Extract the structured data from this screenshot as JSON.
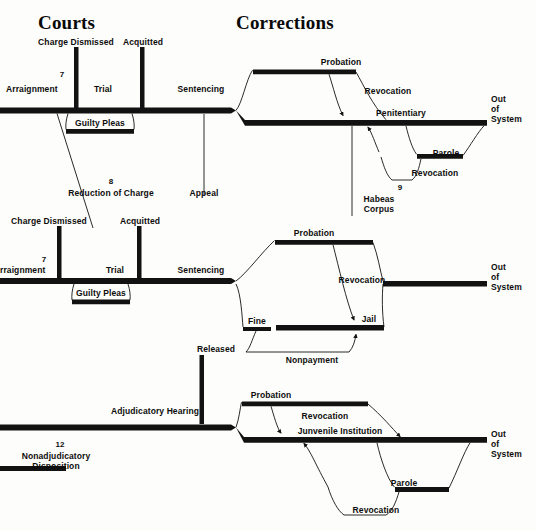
{
  "diagram": {
    "title_courts": "Courts",
    "title_corrections": "Corrections",
    "ink_color": "#121212",
    "paper_color": "#fdfdfb"
  },
  "headers": [
    {
      "name": "courts",
      "text": "Courts",
      "x": 38,
      "y": 14
    },
    {
      "name": "corrections",
      "text": "Corrections",
      "x": 236,
      "y": 14
    }
  ],
  "row_adult_felony": {
    "labels": {
      "charge_dismissed": "Charge Dismissed",
      "acquitted": "Acquitted",
      "arraignment": "Arraignment",
      "arraignment_num": "7",
      "trial": "Trial",
      "sentencing": "Sentencing",
      "guilty_pleas": "Guilty Pleas",
      "reduction_of_charge": "Reduction of Charge",
      "reduction_num": "8",
      "appeal": "Appeal",
      "probation": "Probation",
      "revocation_probation": "Revocation",
      "penitentiary": "Penitentiary",
      "parole": "Parole",
      "revocation_parole": "Revocation",
      "habeas_corpus": "Habeas\nCorpus",
      "habeas_num": "9",
      "out_of_system": "Out\nof\nSystem"
    }
  },
  "row_adult_misdemeanor": {
    "labels": {
      "charge_dismissed": "Charge Dismissed",
      "acquitted": "Acquitted",
      "arraignment": "rraignment",
      "arraignment_num": "7",
      "trial": "Trial",
      "sentencing": "Sentencing",
      "guilty_pleas": "Guilty Pleas",
      "probation": "Probation",
      "revocation": "Revocation",
      "fine": "Fine",
      "jail": "Jail",
      "nonpayment": "Nonpayment",
      "released": "Released",
      "out_of_system": "Out\nof\nSystem"
    }
  },
  "row_juvenile": {
    "labels": {
      "adjudicatory_hearing": "Adjudicatory Hearing",
      "nonadjudicatory_disposition": "Nonadjudicatory\nDisposition",
      "nonadjudicatory_num": "12",
      "probation": "Probation",
      "revocation_probation": "Revocation",
      "juvenile_institution": "Junvenile Institution",
      "parole": "Parole",
      "revocation_parole": "Revocation",
      "out_of_system": "Out\nof\nSystem"
    }
  }
}
